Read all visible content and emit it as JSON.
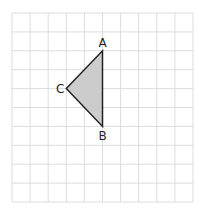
{
  "diagram": {
    "type": "grid-triangle",
    "grid": {
      "cols": 10,
      "rows": 10,
      "line_color": "#dcdcdc"
    },
    "triangle": {
      "fill": "#cccccc",
      "stroke": "#222222",
      "vertices": [
        {
          "label": "A",
          "grid_x": 5,
          "grid_y": 2
        },
        {
          "label": "B",
          "grid_x": 5,
          "grid_y": 6
        },
        {
          "label": "C",
          "grid_x": 3,
          "grid_y": 4
        }
      ]
    }
  }
}
